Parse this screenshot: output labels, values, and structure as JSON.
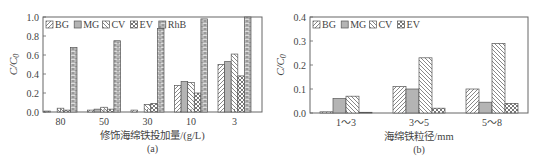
{
  "chart_data": [
    {
      "id": "a",
      "type": "bar",
      "title": "",
      "caption": "(a)",
      "xlabel": "修饰海绵铁投加量/(g/L)",
      "ylabel": "C/C0",
      "ylim": [
        0,
        1.0
      ],
      "yticks": [
        "0.0",
        "0.2",
        "0.4",
        "0.6",
        "0.8",
        "1.0"
      ],
      "grid": false,
      "legend_position": "top-left",
      "categories": [
        "80",
        "50",
        "30",
        "10",
        "3"
      ],
      "series": [
        {
          "name": "BG",
          "pattern": "diag-right",
          "values": [
            0.01,
            0.02,
            0.02,
            0.28,
            0.5
          ]
        },
        {
          "name": "MG",
          "pattern": "gray",
          "values": [
            0.0,
            0.03,
            0.0,
            0.32,
            0.53
          ]
        },
        {
          "name": "CV",
          "pattern": "diag-left",
          "values": [
            0.04,
            0.05,
            0.08,
            0.31,
            0.61
          ]
        },
        {
          "name": "EV",
          "pattern": "cross",
          "values": [
            0.02,
            0.03,
            0.09,
            0.2,
            0.38
          ]
        },
        {
          "name": "RhB",
          "pattern": "brick",
          "values": [
            0.68,
            0.75,
            0.88,
            0.98,
            1.0
          ]
        }
      ]
    },
    {
      "id": "b",
      "type": "bar",
      "title": "",
      "caption": "(b)",
      "xlabel": "海绵铁粒径/mm",
      "ylabel": "C/C0",
      "ylim": [
        0,
        0.4
      ],
      "yticks": [
        "0.0",
        "0.1",
        "0.2",
        "0.3",
        "0.4"
      ],
      "grid": false,
      "legend_position": "top-left",
      "categories": [
        "1～3",
        "3～5",
        "5～8"
      ],
      "series": [
        {
          "name": "BG",
          "pattern": "diag-right",
          "values": [
            0.005,
            0.11,
            0.1
          ]
        },
        {
          "name": "MG",
          "pattern": "gray",
          "values": [
            0.06,
            0.1,
            0.045
          ]
        },
        {
          "name": "CV",
          "pattern": "diag-left",
          "values": [
            0.07,
            0.23,
            0.29
          ]
        },
        {
          "name": "EV",
          "pattern": "cross",
          "values": [
            0.003,
            0.02,
            0.04
          ]
        }
      ]
    }
  ]
}
